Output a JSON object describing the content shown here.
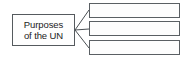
{
  "diagram": {
    "type": "hierarchy-fan-out",
    "canvas": {
      "width": 191,
      "height": 59,
      "background": "#ffffff"
    },
    "colors": {
      "box_border": "#555a5e",
      "box_fill": "#fefefe",
      "connector": "#4a4f53",
      "text": "#1b1b1b"
    },
    "root": {
      "name": "Purposes of the UN",
      "label_line_1": "Purposes",
      "label_line_2": "of the UN",
      "box": {
        "x": 12,
        "y": 14,
        "width": 63,
        "height": 32
      }
    },
    "branches": [
      {
        "index": 1,
        "text": "",
        "box": {
          "x": 89,
          "y": 3,
          "width": 91,
          "height": 15
        }
      },
      {
        "index": 2,
        "text": "",
        "box": {
          "x": 89,
          "y": 21,
          "width": 91,
          "height": 15
        }
      },
      {
        "index": 3,
        "text": "",
        "box": {
          "x": 89,
          "y": 40,
          "width": 91,
          "height": 15
        }
      }
    ],
    "connectors": {
      "origin": {
        "x": 75,
        "y": 30
      },
      "endpoints": [
        {
          "x": 89,
          "y": 10
        },
        {
          "x": 89,
          "y": 29
        },
        {
          "x": 89,
          "y": 48
        }
      ],
      "stroke_width": 1
    }
  }
}
